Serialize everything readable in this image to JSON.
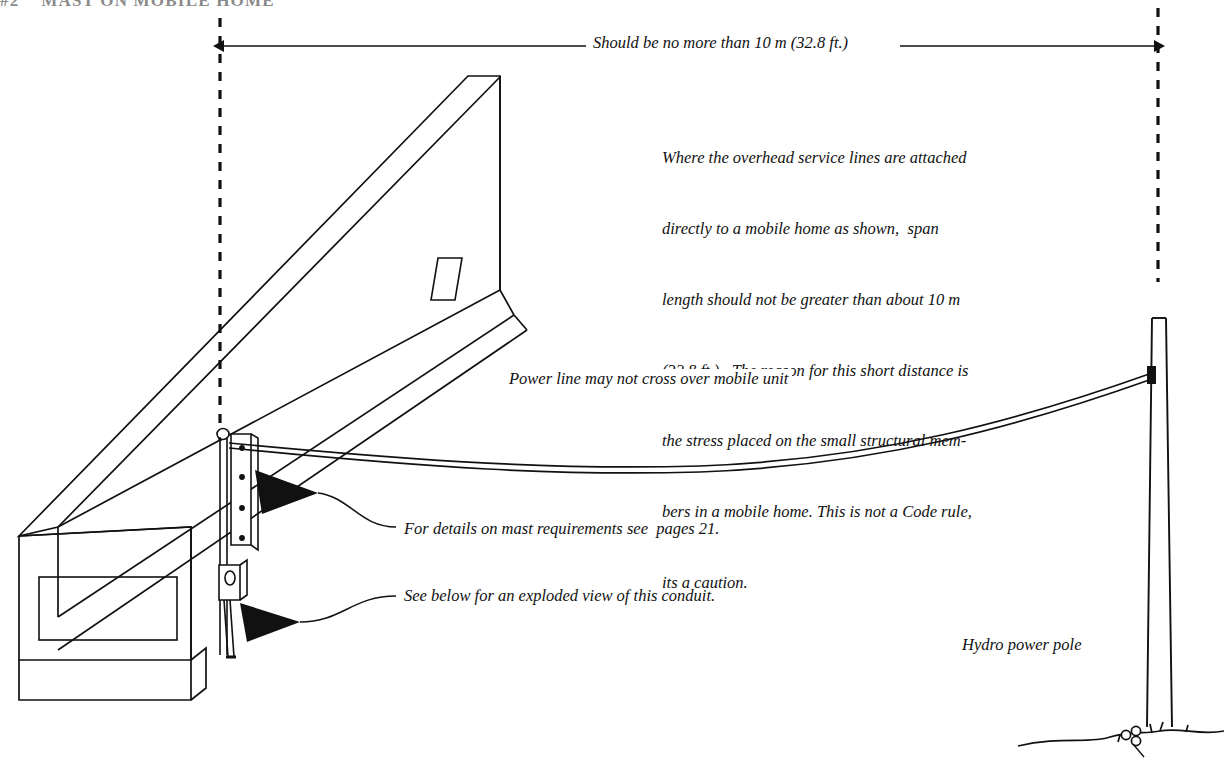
{
  "page": {
    "header": "#2    MAST ON MOBILE HOME",
    "width": 1224,
    "height": 773,
    "background": "#ffffff",
    "ink": "#111111"
  },
  "dimension": {
    "label": "Should be no more than 10 m (32.8 ft.)",
    "left_extension_dashed": true,
    "right_extension_dashed": true
  },
  "caption": {
    "lines": [
      "Where the overhead service lines are attached",
      "directly to a mobile home as shown,  span",
      "length should not be greater than about 10 m",
      "(32.8 ft.).  The reason for this short distance is",
      "the stress placed on the small structural mem-",
      "bers in a mobile home. This is not a Code rule,",
      "its a caution."
    ]
  },
  "annotations": {
    "power_line": "Power line may not cross over mobile unit",
    "mast_detail": "For details on mast requirements see  pages 21.",
    "conduit_detail": "See below for an exploded view of this conduit.",
    "pole": "Hydro power pole"
  },
  "drawing": {
    "mobile_home": "isometric-trailer",
    "mast_assembly": "service-mast-with-weatherhead-and-meter",
    "service_drop": "catenary-span",
    "utility_pole": "hydro-pole",
    "ground": "ground-line-with-shrub"
  }
}
